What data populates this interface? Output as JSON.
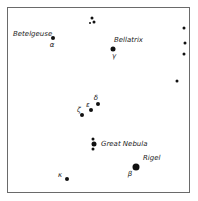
{
  "chart": {
    "labels": {
      "betelgeuse": "Betelgeuse",
      "bellatrix": "Bellatrix",
      "great_nebula": "Great Nebula",
      "rigel": "Rigel"
    },
    "greek": {
      "alpha": "α",
      "gamma": "γ",
      "zeta": "ζ",
      "epsilon": "ε",
      "delta": "δ",
      "kappa": "κ",
      "beta": "β"
    }
  }
}
